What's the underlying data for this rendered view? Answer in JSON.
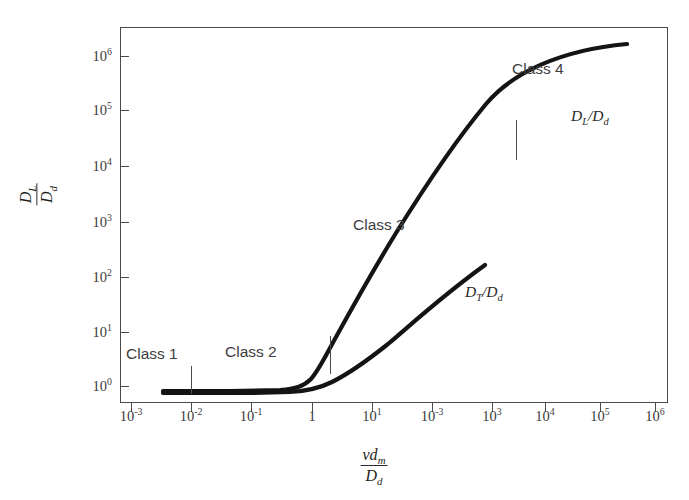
{
  "chart_data": {
    "type": "line",
    "title": "",
    "xlabel": "v d_m / D_d",
    "ylabel": "D_L / D_d",
    "xscale": "log",
    "yscale": "log",
    "xlim": [
      0.001,
      1000000
    ],
    "ylim": [
      0.4,
      3000000
    ],
    "grid": false,
    "legend_position": "inline-curve-labels",
    "xticklabels": [
      "10-3",
      "10-2",
      "10-1",
      "1",
      "101",
      "10-3",
      "103",
      "104",
      "105",
      "106"
    ],
    "xtick_bases": [
      "10",
      "10",
      "10",
      "1",
      "10",
      "10",
      "10",
      "10",
      "10",
      "10"
    ],
    "xtick_exponents": [
      "-3",
      "-2",
      "-1",
      "",
      "1",
      "-3",
      "3",
      "4",
      "5",
      "6"
    ],
    "yticklabels": [
      "100",
      "101",
      "102",
      "103",
      "104",
      "105",
      "106"
    ],
    "ytick_bases": [
      "10",
      "10",
      "10",
      "10",
      "10",
      "10",
      "10"
    ],
    "ytick_exponents": [
      "0",
      "1",
      "2",
      "3",
      "4",
      "5",
      "6"
    ],
    "series": [
      {
        "name": "DL/Dd",
        "label": "D_L/D_d",
        "points_xy": [
          [
            0.008,
            0.62
          ],
          [
            0.1,
            0.62
          ],
          [
            0.5,
            0.62
          ],
          [
            0.8,
            0.63
          ],
          [
            1.2,
            0.68
          ],
          [
            2.0,
            0.9
          ],
          [
            3.0,
            1.5
          ],
          [
            5.0,
            3.5
          ],
          [
            10.0,
            14.0
          ],
          [
            40.0,
            150.0
          ],
          [
            200.0,
            1200.0
          ],
          [
            2000.0,
            12000.0
          ],
          [
            10000.0,
            42000.0
          ],
          [
            100000.0,
            330000.0
          ],
          [
            700000.0,
            1500000.0
          ]
        ]
      },
      {
        "name": "DT/Dd",
        "label": "D_T/D_d",
        "points_xy": [
          [
            0.008,
            0.6
          ],
          [
            0.5,
            0.6
          ],
          [
            1.0,
            0.61
          ],
          [
            2.0,
            0.66
          ],
          [
            5.0,
            0.85
          ],
          [
            12.0,
            1.5
          ],
          [
            50.0,
            4.5
          ],
          [
            300.0,
            18.0
          ],
          [
            2000.0,
            70.0
          ],
          [
            7000.0,
            150.0
          ]
        ]
      }
    ],
    "annotations": [
      {
        "text": "Class 1",
        "x": 0.0022,
        "y": 2.2
      },
      {
        "text": "Class 2",
        "x": 0.22,
        "y": 2.2
      },
      {
        "text": "Class 3",
        "x": 35.0,
        "y": 420.0
      },
      {
        "text": "Class 4",
        "x": 9000.0,
        "y": 330000.0
      }
    ],
    "class_dividers": [
      {
        "label": "class1-class2-divider",
        "x": 0.01,
        "y_center": 0.75
      },
      {
        "label": "class2-class3-divider",
        "x": 5.0,
        "y_center": 3.2
      },
      {
        "label": "class3-class4-divider",
        "x": 10000.0,
        "y_center": 20000.0
      }
    ],
    "curve_labels": [
      {
        "text": "D_L/D_d",
        "x": 200000.0,
        "y": 110000.0
      },
      {
        "text": "D_T/D_d",
        "x": 6000.0,
        "y": 45.0
      }
    ]
  },
  "axis": {
    "y_title": {
      "numerator_base": "D",
      "numerator_sub": "L",
      "denominator_base": "D",
      "denominator_sub": "d"
    },
    "x_title": {
      "numerator_base": "vd",
      "numerator_sub": "m",
      "denominator_base": "D",
      "denominator_sub": "d"
    }
  },
  "colors": {
    "background": "#ffffff",
    "frame": "#4a4a4a",
    "curve": "#1a1a1a",
    "text": "#3b3b3b",
    "annotation": "#3d3d3d"
  },
  "labels": {
    "class1": "Class 1",
    "class2": "Class 2",
    "class3": "Class 3",
    "class4": "Class 4",
    "curve_DL": "D",
    "curve_DL_sub": "L",
    "curve_DL_den": "/D",
    "curve_DL_den_sub": "d",
    "curve_DT": "D",
    "curve_DT_sub": "T",
    "curve_DT_den": "/D",
    "curve_DT_den_sub": "d"
  },
  "xticks": [
    {
      "base": "10",
      "exp": "-3",
      "px": 131
    },
    {
      "base": "10",
      "exp": "-2",
      "px": 191
    },
    {
      "base": "10",
      "exp": "-1",
      "px": 251
    },
    {
      "base": "1",
      "exp": "",
      "px": 312
    },
    {
      "base": "10",
      "exp": "1",
      "px": 372
    },
    {
      "base": "10",
      "exp": "-3",
      "px": 432
    },
    {
      "base": "10",
      "exp": "3",
      "px": 492
    },
    {
      "base": "10",
      "exp": "4",
      "px": 545
    },
    {
      "base": "10",
      "exp": "5",
      "px": 600
    },
    {
      "base": "10",
      "exp": "6",
      "px": 655
    }
  ],
  "yticks": [
    {
      "base": "10",
      "exp": "6",
      "px": 56
    },
    {
      "base": "10",
      "exp": "5",
      "px": 110
    },
    {
      "base": "10",
      "exp": "4",
      "px": 166
    },
    {
      "base": "10",
      "exp": "3",
      "px": 222
    },
    {
      "base": "10",
      "exp": "2",
      "px": 277
    },
    {
      "base": "10",
      "exp": "1",
      "px": 332
    },
    {
      "base": "10",
      "exp": "0",
      "px": 386
    }
  ]
}
